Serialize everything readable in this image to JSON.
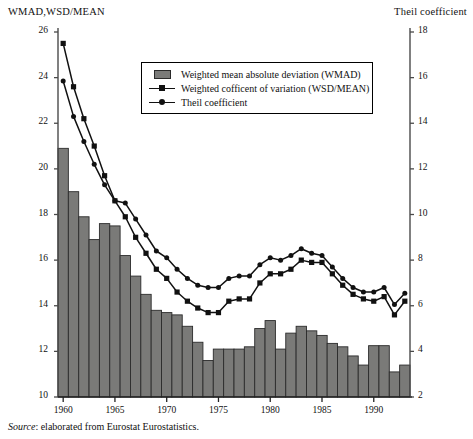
{
  "left_axis_title": "WMAD,WSD/MEAN",
  "right_axis_title": "Theil coefficient",
  "source_caption": {
    "label": "Source",
    "text": ": elaborated from Eurostat Eurostatistics."
  },
  "legend": {
    "items": [
      {
        "key": "bar-swatch",
        "label": "Weighted mean absolute deviation (WMAD)"
      },
      {
        "key": "line-square",
        "label": "Weighted cofficent of variation (WSD/MEAN)"
      },
      {
        "key": "line-dot",
        "label": "Theil coefficient"
      }
    ]
  },
  "colors": {
    "bar_fill": "#7a7a78",
    "bar_stroke": "#2b2b2b",
    "line": "#111111",
    "axis": "#4a4a4a",
    "background": "#ffffff"
  },
  "chart_data": {
    "type": "bar",
    "title": "",
    "subtitle": "",
    "xlabel": "",
    "ylabel": "WMAD,WSD/MEAN",
    "y2label": "Theil coefficient",
    "ylim": [
      10,
      26
    ],
    "y2lim": [
      2,
      18
    ],
    "xlim": [
      1959.5,
      1993.5
    ],
    "grid": false,
    "legend_position": "top-center",
    "ytick_labels": [
      "10",
      "12",
      "14",
      "16",
      "18",
      "20",
      "22",
      "24",
      "26"
    ],
    "ytick_values": [
      10,
      12,
      14,
      16,
      18,
      20,
      22,
      24,
      26
    ],
    "y2tick_labels": [
      "2",
      "4",
      "6",
      "8",
      "10",
      "12",
      "14",
      "16",
      "18"
    ],
    "y2tick_values": [
      2,
      4,
      6,
      8,
      10,
      12,
      14,
      16,
      18
    ],
    "xtick_labels": [
      "1960",
      "1965",
      "1970",
      "1975",
      "1980",
      "1985",
      "1990"
    ],
    "xtick_values": [
      1960,
      1965,
      1970,
      1975,
      1980,
      1985,
      1990
    ],
    "categories": [
      1960,
      1961,
      1962,
      1963,
      1964,
      1965,
      1966,
      1967,
      1968,
      1969,
      1970,
      1971,
      1972,
      1973,
      1974,
      1975,
      1976,
      1977,
      1978,
      1979,
      1980,
      1981,
      1982,
      1983,
      1984,
      1985,
      1986,
      1987,
      1988,
      1989,
      1990,
      1991,
      1992,
      1993
    ],
    "series": [
      {
        "name": "Weighted mean absolute deviation (WMAD)",
        "type": "bar",
        "axis": "left",
        "values": [
          20.9,
          19.0,
          17.9,
          16.9,
          17.6,
          17.5,
          16.2,
          15.3,
          14.5,
          13.8,
          13.7,
          13.6,
          13.1,
          12.4,
          11.6,
          12.1,
          12.1,
          12.1,
          12.2,
          13.0,
          13.35,
          12.1,
          12.8,
          13.1,
          12.9,
          12.7,
          12.35,
          12.2,
          11.8,
          11.4,
          12.25,
          12.25,
          11.1,
          11.4
        ]
      },
      {
        "name": "Weighted cofficent of variation (WSD/MEAN)",
        "type": "line",
        "marker": "square",
        "axis": "left",
        "values": [
          25.5,
          23.6,
          22.2,
          21.0,
          19.7,
          18.6,
          17.9,
          17.0,
          16.3,
          15.6,
          15.2,
          14.6,
          14.2,
          13.9,
          13.7,
          13.7,
          14.2,
          14.3,
          14.3,
          15.0,
          15.4,
          15.4,
          15.6,
          16.0,
          15.9,
          15.9,
          15.4,
          14.9,
          14.5,
          14.3,
          14.2,
          14.4,
          13.6,
          14.2
        ]
      },
      {
        "name": "Theil coefficient",
        "type": "line",
        "marker": "dot",
        "axis": "right",
        "values": [
          15.85,
          14.3,
          13.2,
          12.2,
          11.3,
          10.6,
          10.5,
          9.8,
          9.1,
          8.4,
          8.1,
          7.6,
          7.2,
          6.9,
          6.8,
          6.8,
          7.2,
          7.3,
          7.3,
          7.8,
          8.1,
          8.0,
          8.2,
          8.5,
          8.3,
          8.2,
          7.7,
          7.2,
          6.8,
          6.6,
          6.6,
          6.8,
          6.05,
          6.55
        ]
      }
    ]
  }
}
